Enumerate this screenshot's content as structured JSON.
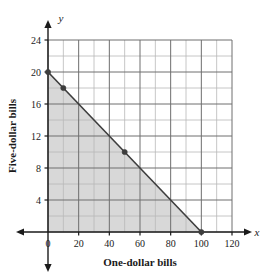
{
  "chart_data": {
    "type": "area",
    "title": "",
    "xlabel": "One-dollar bills",
    "ylabel": "Five-dollar bills",
    "x_axis_symbol": "x",
    "y_axis_symbol": "y",
    "xlim": [
      0,
      120
    ],
    "ylim": [
      0,
      24
    ],
    "x_ticks": [
      0,
      20,
      40,
      60,
      80,
      100,
      120
    ],
    "x_tick_labels": [
      "0",
      "20",
      "40",
      "60",
      "80",
      "100",
      "120"
    ],
    "y_ticks": [
      4,
      8,
      12,
      16,
      20,
      24
    ],
    "y_tick_labels": [
      "4",
      "8",
      "12",
      "16",
      "20",
      "24"
    ],
    "x_minor_step": 10,
    "y_minor_step": 2,
    "grid": true,
    "legend": "none",
    "series": [
      {
        "name": "boundary-line",
        "kind": "line",
        "x": [
          0,
          100
        ],
        "y": [
          20,
          0
        ],
        "color": "#3d3d3d"
      },
      {
        "name": "shaded-region",
        "kind": "polygon",
        "x": [
          0,
          0,
          100
        ],
        "y": [
          0,
          20,
          0
        ],
        "fill": "#d8d8d8"
      }
    ],
    "points": [
      {
        "x": 0,
        "y": 20
      },
      {
        "x": 10,
        "y": 18
      },
      {
        "x": 50,
        "y": 10
      },
      {
        "x": 100,
        "y": 0
      }
    ],
    "colors": {
      "region_fill": "#d8d8d8",
      "line": "#3d3d3d",
      "grid_major": "#6e6e6e",
      "grid_minor": "#b8b8b8",
      "axis": "#1a1a1a",
      "text": "#1a1a1a",
      "background": "#ffffff"
    }
  }
}
